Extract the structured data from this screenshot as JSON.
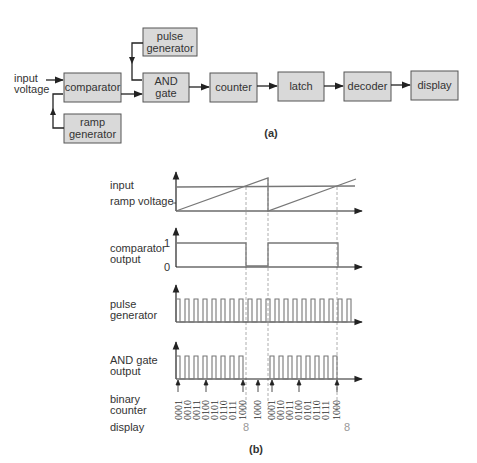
{
  "block_diagram": {
    "input_label_line1": "input",
    "input_label_line2": "voltage",
    "blocks": {
      "comparator": "comparator",
      "ramp_generator_line1": "ramp",
      "ramp_generator_line2": "generator",
      "pulse_generator_line1": "pulse",
      "pulse_generator_line2": "generator",
      "and_gate_line1": "AND",
      "and_gate_line2": "gate",
      "counter": "counter",
      "latch": "latch",
      "decoder": "decoder",
      "display": "display"
    },
    "caption": "(a)"
  },
  "timing_diagram": {
    "row_labels": {
      "input": "input",
      "ramp_voltage": "ramp voltage",
      "comparator_line1": "comparator",
      "comparator_line2": "output",
      "comparator_high": "1",
      "comparator_low": "0",
      "pulse_line1": "pulse",
      "pulse_line2": "generator",
      "and_line1": "AND gate",
      "and_line2": "output",
      "binary_line1": "binary",
      "binary_line2": "counter",
      "display": "display"
    },
    "counter_values_group1": [
      "0001",
      "0010",
      "0011",
      "0100",
      "0101",
      "0110",
      "0111",
      "1000"
    ],
    "counter_value_reset": "1000",
    "counter_values_group2": [
      "0001",
      "0010",
      "0011",
      "0100",
      "0101",
      "0110",
      "0111",
      "1000"
    ],
    "display_values": [
      "8",
      "8"
    ],
    "caption": "(b)"
  },
  "colors": {
    "box_fill": "#d9d9d9",
    "box_stroke": "#555555",
    "line": "#222222",
    "waveform": "#777777",
    "dashed": "#999999",
    "display_digit": "#999999"
  }
}
